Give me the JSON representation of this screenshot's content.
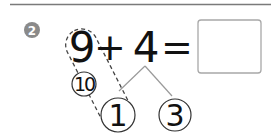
{
  "problem": {
    "number": "2",
    "term1": "9",
    "operator": "+",
    "term2": "4",
    "equals": "=",
    "answer": "",
    "decomposition": {
      "parts": [
        "1",
        "3"
      ],
      "make_ten_label": "10"
    }
  },
  "colors": {
    "badge": "#8a8a8a",
    "rule": "#7a7a7a",
    "lines": "#9a9a9a",
    "ink": "#111111",
    "box_border": "#a8a8a8"
  }
}
